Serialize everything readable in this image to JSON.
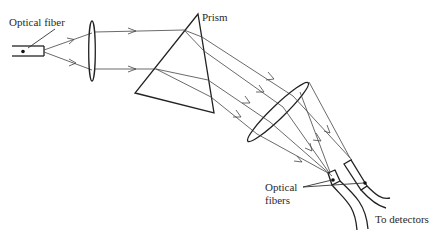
{
  "figure": {
    "type": "optical-schematic"
  },
  "labels": {
    "input_fiber": "Optical fiber",
    "prism": "Prism",
    "output_fibers_line1": "Optical",
    "output_fibers_line2": "fibers",
    "detectors": "To detectors"
  },
  "components": [
    {
      "id": "input-fiber",
      "name": "Optical fiber"
    },
    {
      "id": "collimating-lens",
      "name": "Lens"
    },
    {
      "id": "prism",
      "name": "Prism"
    },
    {
      "id": "focusing-lens",
      "name": "Lens"
    },
    {
      "id": "output-fibers",
      "name": "Optical fibers",
      "count": 2
    }
  ],
  "colors": {
    "line": "#333333",
    "background": "#ffffff"
  }
}
